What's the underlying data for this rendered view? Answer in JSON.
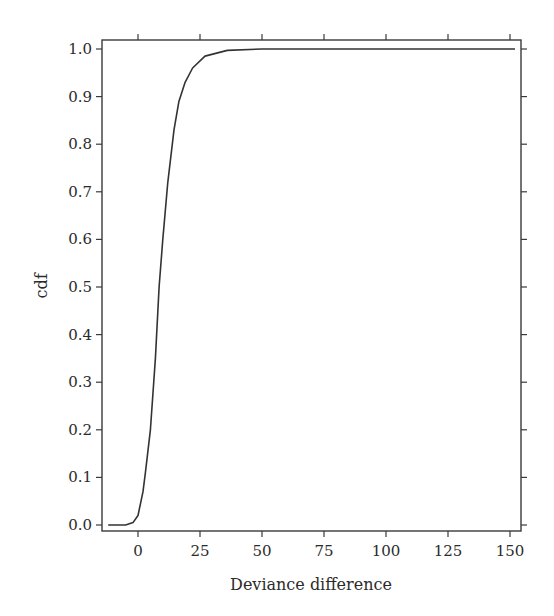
{
  "chart_data": {
    "type": "line",
    "title": "",
    "xlabel": "Deviance difference",
    "ylabel": "cdf",
    "xlim": [
      -14,
      155
    ],
    "ylim": [
      -0.012,
      1.012
    ],
    "grid": false,
    "legend": null,
    "xticks": [
      0,
      25,
      50,
      75,
      100,
      125,
      150
    ],
    "xtick_labels": [
      "0",
      "25",
      "50",
      "75",
      "100",
      "125",
      "150"
    ],
    "yticks": [
      0.0,
      0.1,
      0.2,
      0.3,
      0.4,
      0.5,
      0.6,
      0.7,
      0.8,
      0.9,
      1.0
    ],
    "ytick_labels": [
      "0.0",
      "0.1",
      "0.2",
      "0.3",
      "0.4",
      "0.5",
      "0.6",
      "0.7",
      "0.8",
      "0.9",
      "1.0"
    ],
    "series": [
      {
        "name": "cdf",
        "color": "#333333",
        "x": [
          -12,
          -5,
          -2,
          0,
          2,
          3,
          5,
          7,
          8.5,
          10,
          12,
          14.5,
          16.5,
          19,
          22,
          27,
          36,
          50,
          75,
          100,
          125,
          152
        ],
        "y": [
          0.0,
          0.0,
          0.005,
          0.02,
          0.07,
          0.11,
          0.2,
          0.35,
          0.5,
          0.6,
          0.72,
          0.83,
          0.89,
          0.93,
          0.96,
          0.985,
          0.997,
          1.0,
          1.0,
          1.0,
          1.0,
          1.0
        ]
      }
    ]
  }
}
